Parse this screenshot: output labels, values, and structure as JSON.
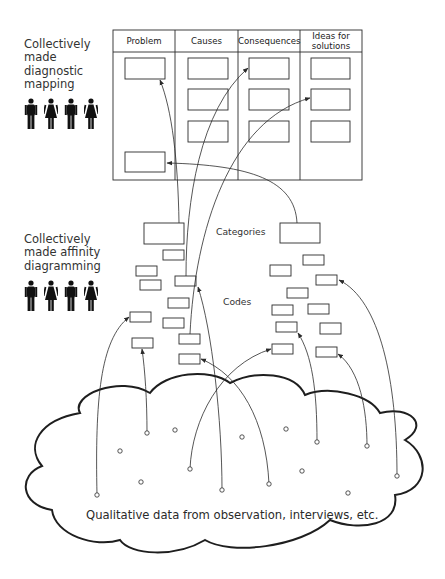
{
  "diagnostic_section": {
    "label": "Collectively\nmade\ndiagnostic\nmapping",
    "people": [
      "man-icon",
      "woman-icon",
      "man-icon",
      "woman-icon"
    ]
  },
  "affinity_section": {
    "label": "Collectively\nmade affinity\ndiagramming",
    "people": [
      "man-icon",
      "woman-icon",
      "man-icon",
      "woman-icon"
    ]
  },
  "mapping_table": {
    "columns": [
      {
        "label": "Problem",
        "x": 113,
        "w": 62
      },
      {
        "label": "Causes",
        "x": 175,
        "w": 63
      },
      {
        "label": "Consequences",
        "x": 238,
        "w": 62
      },
      {
        "label": "Ideas for\nsolutions",
        "x": 300,
        "w": 62
      }
    ],
    "frame": {
      "x": 113,
      "y": 30,
      "w": 249,
      "h": 150,
      "header_h": 22
    },
    "boxes": [
      [
        125,
        58,
        40,
        21
      ],
      [
        125,
        152,
        40,
        20
      ],
      [
        188,
        58,
        40,
        21
      ],
      [
        188,
        89,
        40,
        21
      ],
      [
        188,
        121,
        40,
        21
      ],
      [
        249,
        58,
        40,
        21
      ],
      [
        249,
        89,
        40,
        21
      ],
      [
        249,
        121,
        40,
        21
      ],
      [
        311,
        58,
        39,
        21
      ],
      [
        311,
        89,
        39,
        21
      ],
      [
        311,
        121,
        39,
        21
      ]
    ]
  },
  "labels": {
    "categories": "Categories",
    "codes": "Codes",
    "cloud": "Qualitative data from observation, interviews, etc."
  },
  "category_boxes": [
    [
      144,
      223,
      40,
      21
    ],
    [
      280,
      223,
      40,
      20
    ]
  ],
  "code_boxes": [
    [
      163,
      250,
      21,
      10
    ],
    [
      136,
      266,
      21,
      10
    ],
    [
      140,
      280,
      21,
      10
    ],
    [
      175,
      276,
      21,
      10
    ],
    [
      168,
      298,
      21,
      10
    ],
    [
      130,
      312,
      21,
      10
    ],
    [
      163,
      318,
      21,
      10
    ],
    [
      132,
      338,
      21,
      10
    ],
    [
      179,
      334,
      21,
      10
    ],
    [
      179,
      354,
      21,
      10
    ],
    [
      303,
      255,
      21,
      10
    ],
    [
      270,
      265,
      21,
      11
    ],
    [
      316,
      275,
      21,
      10
    ],
    [
      287,
      288,
      21,
      10
    ],
    [
      272,
      305,
      21,
      10
    ],
    [
      308,
      304,
      21,
      10
    ],
    [
      276,
      322,
      21,
      10
    ],
    [
      320,
      323,
      21,
      11
    ],
    [
      272,
      344,
      21,
      10
    ],
    [
      316,
      347,
      21,
      10
    ]
  ],
  "data_points": [
    [
      97,
      495
    ],
    [
      147,
      433
    ],
    [
      175,
      430
    ],
    [
      120,
      451
    ],
    [
      141,
      482
    ],
    [
      190,
      469
    ],
    [
      222,
      490
    ],
    [
      242,
      437
    ],
    [
      286,
      429
    ],
    [
      317,
      442
    ],
    [
      302,
      471
    ],
    [
      269,
      484
    ],
    [
      348,
      493
    ],
    [
      367,
      446
    ],
    [
      397,
      476
    ]
  ],
  "links": [
    {
      "d": "M 179 223 C 178 160, 172 110, 160 80",
      "arrow": true
    },
    {
      "d": "M 186 276 C 186 200, 200 110, 248 68",
      "arrow": true
    },
    {
      "d": "M 190 334 C 195 230, 230 120, 310 98",
      "arrow": true
    },
    {
      "d": "M 297 223 C 295 180, 250 165, 167 163",
      "arrow": true
    },
    {
      "d": "M 97 495 C 95 400, 100 340, 129 317",
      "arrow": true
    },
    {
      "d": "M 147 433 C 147 400, 145 370, 142 349",
      "arrow": true
    },
    {
      "d": "M 222 490 C 222 420, 212 330, 198 287",
      "arrow": true
    },
    {
      "d": "M 269 484 C 266 420, 240 375, 201 359",
      "arrow": true
    },
    {
      "d": "M 190 469 C 192 420, 220 365, 271 349",
      "arrow": true
    },
    {
      "d": "M 317 442 C 317 390, 312 355, 298 333",
      "arrow": true
    },
    {
      "d": "M 367 446 C 367 410, 360 370, 338 354",
      "arrow": true
    },
    {
      "d": "M 397 476 C 397 380, 380 300, 339 280",
      "arrow": true
    }
  ],
  "colors": {
    "line": "#2b2b2b",
    "cloud": "#1e1e1e",
    "text": "#2a2a2a",
    "background": "#ffffff"
  }
}
